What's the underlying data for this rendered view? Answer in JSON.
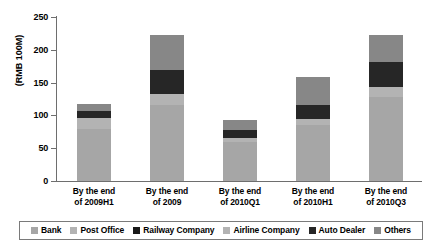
{
  "chart_data": {
    "type": "bar",
    "subtype": "stacked-bar",
    "title": "",
    "xlabel": "",
    "ylabel": "(RMB 100M)",
    "ylim": [
      0,
      250
    ],
    "yticks": [
      0,
      50,
      100,
      150,
      200,
      250
    ],
    "grid": false,
    "legend_position": "bottom",
    "categories": [
      "By the end of 2009H1",
      "By the end of 2009",
      "By the end of 2010Q1",
      "By the end of 2010H1",
      "By the end of 2010Q3"
    ],
    "category_lines": [
      [
        "By the end",
        "of 2009H1"
      ],
      [
        "By the end",
        "of 2009"
      ],
      [
        "By the end",
        "of 2010Q1"
      ],
      [
        "By the end",
        "of 2010H1"
      ],
      [
        "By the end",
        "of 2010Q3"
      ]
    ],
    "series": [
      {
        "name": "Bank",
        "color": "#a6a6a6",
        "values": [
          80,
          116,
          60,
          86,
          128
        ]
      },
      {
        "name": "Post Office",
        "color": "#b3b3b3",
        "values": [
          0,
          0,
          0,
          0,
          0
        ]
      },
      {
        "name": "Railway Company",
        "color": "#1a1a1a",
        "values": [
          0,
          0,
          0,
          0,
          0
        ]
      },
      {
        "name": "Airline Company",
        "color": "#b3b3b3",
        "values": [
          16,
          17,
          6,
          9,
          15
        ]
      },
      {
        "name": "Auto Dealer",
        "color": "#262626",
        "values": [
          11,
          37,
          12,
          21,
          38
        ]
      },
      {
        "name": "Others",
        "color": "#878787",
        "values": [
          11,
          53,
          15,
          43,
          42
        ]
      }
    ],
    "totals": [
      118,
      223,
      93,
      159,
      223
    ]
  },
  "legend": {
    "items": [
      {
        "label": "Bank",
        "color": "#a6a6a6"
      },
      {
        "label": "Post Office",
        "color": "#b3b3b3"
      },
      {
        "label": "Railway Company",
        "color": "#1a1a1a"
      },
      {
        "label": "Airline Company",
        "color": "#b3b3b3"
      },
      {
        "label": "Auto Dealer",
        "color": "#262626"
      },
      {
        "label": "Others",
        "color": "#878787"
      }
    ]
  },
  "axis": {
    "y_title": "(RMB 100M)",
    "y_labels": [
      "250",
      "200",
      "150",
      "100",
      "50",
      "0"
    ]
  }
}
